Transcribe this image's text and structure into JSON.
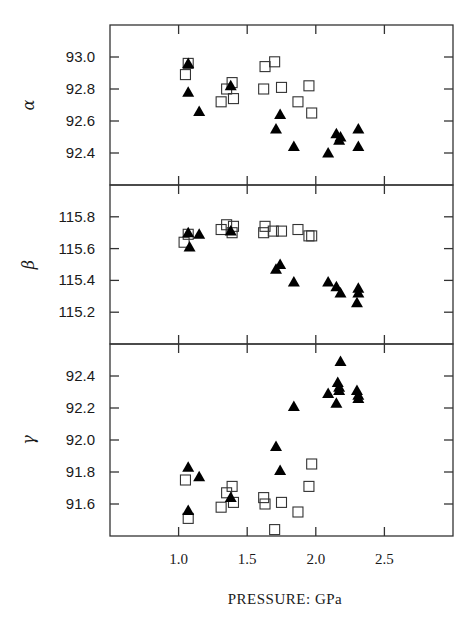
{
  "chart_data": {
    "type": "scatter",
    "xlabel": "PRESSURE: GPa",
    "xlim": [
      0.5,
      3.0
    ],
    "xticks": [
      1.0,
      1.5,
      2.0,
      2.5
    ],
    "xtick_labels": [
      "1.0",
      "1.5",
      "2.0",
      "2.5"
    ],
    "legend": null,
    "grid": false,
    "series_markers": {
      "open": "open-square",
      "filled": "filled-triangle"
    },
    "panels": [
      {
        "ylabel": "α",
        "ylim": [
          92.2,
          93.2
        ],
        "yticks": [
          92.4,
          92.6,
          92.8,
          93.0
        ],
        "ytick_labels": [
          "92.4",
          "92.6",
          "92.8",
          "93.0"
        ],
        "series": [
          {
            "name": "open squares",
            "points": [
              [
                1.07,
                92.96
              ],
              [
                1.05,
                92.89
              ],
              [
                1.35,
                92.8
              ],
              [
                1.31,
                92.72
              ],
              [
                1.39,
                92.84
              ],
              [
                1.4,
                92.74
              ],
              [
                1.63,
                92.94
              ],
              [
                1.7,
                92.97
              ],
              [
                1.62,
                92.8
              ],
              [
                1.75,
                92.81
              ],
              [
                1.87,
                92.72
              ],
              [
                1.95,
                92.82
              ],
              [
                1.97,
                92.65
              ]
            ]
          },
          {
            "name": "filled triangles",
            "points": [
              [
                1.07,
                92.96
              ],
              [
                1.07,
                92.78
              ],
              [
                1.15,
                92.66
              ],
              [
                1.38,
                92.82
              ],
              [
                1.71,
                92.55
              ],
              [
                1.74,
                92.64
              ],
              [
                1.84,
                92.44
              ],
              [
                2.09,
                92.4
              ],
              [
                2.15,
                92.52
              ],
              [
                2.17,
                92.48
              ],
              [
                2.18,
                92.5
              ],
              [
                2.31,
                92.55
              ],
              [
                2.31,
                92.44
              ]
            ]
          }
        ]
      },
      {
        "ylabel": "β",
        "ylim": [
          115.0,
          116.0
        ],
        "yticks": [
          115.2,
          115.4,
          115.6,
          115.8
        ],
        "ytick_labels": [
          "115.2",
          "115.4",
          "115.6",
          "115.8"
        ],
        "series": [
          {
            "name": "open squares",
            "points": [
              [
                1.04,
                115.64
              ],
              [
                1.07,
                115.69
              ],
              [
                1.31,
                115.72
              ],
              [
                1.35,
                115.75
              ],
              [
                1.4,
                115.74
              ],
              [
                1.39,
                115.7
              ],
              [
                1.63,
                115.74
              ],
              [
                1.62,
                115.7
              ],
              [
                1.69,
                115.71
              ],
              [
                1.75,
                115.71
              ],
              [
                1.87,
                115.72
              ],
              [
                1.95,
                115.68
              ],
              [
                1.97,
                115.68
              ]
            ]
          },
          {
            "name": "filled triangles",
            "points": [
              [
                1.07,
                115.7
              ],
              [
                1.08,
                115.61
              ],
              [
                1.15,
                115.69
              ],
              [
                1.38,
                115.71
              ],
              [
                1.71,
                115.47
              ],
              [
                1.74,
                115.5
              ],
              [
                1.84,
                115.39
              ],
              [
                2.09,
                115.39
              ],
              [
                2.15,
                115.36
              ],
              [
                2.18,
                115.32
              ],
              [
                2.31,
                115.35
              ],
              [
                2.31,
                115.32
              ],
              [
                2.3,
                115.26
              ]
            ]
          }
        ]
      },
      {
        "ylabel": "γ",
        "ylim": [
          91.4,
          92.6
        ],
        "yticks": [
          91.6,
          91.8,
          92.0,
          92.2,
          92.4
        ],
        "ytick_labels": [
          "91.6",
          "91.8",
          "92.0",
          "92.2",
          "92.4"
        ],
        "series": [
          {
            "name": "open squares",
            "points": [
              [
                1.05,
                91.75
              ],
              [
                1.07,
                91.51
              ],
              [
                1.31,
                91.58
              ],
              [
                1.35,
                91.67
              ],
              [
                1.39,
                91.71
              ],
              [
                1.4,
                91.61
              ],
              [
                1.62,
                91.64
              ],
              [
                1.63,
                91.6
              ],
              [
                1.75,
                91.61
              ],
              [
                1.87,
                91.55
              ],
              [
                1.95,
                91.71
              ],
              [
                1.97,
                91.85
              ],
              [
                1.7,
                91.44
              ]
            ]
          },
          {
            "name": "filled triangles",
            "points": [
              [
                2.18,
                92.49
              ],
              [
                2.16,
                92.36
              ],
              [
                2.17,
                92.33
              ],
              [
                2.17,
                92.31
              ],
              [
                2.09,
                92.29
              ],
              [
                2.15,
                92.23
              ],
              [
                2.3,
                92.31
              ],
              [
                2.31,
                92.28
              ],
              [
                2.31,
                92.26
              ],
              [
                1.84,
                92.21
              ],
              [
                1.71,
                91.96
              ],
              [
                1.74,
                91.81
              ],
              [
                1.07,
                91.83
              ],
              [
                1.15,
                91.77
              ],
              [
                1.38,
                91.64
              ],
              [
                1.07,
                91.56
              ]
            ]
          }
        ]
      }
    ]
  }
}
